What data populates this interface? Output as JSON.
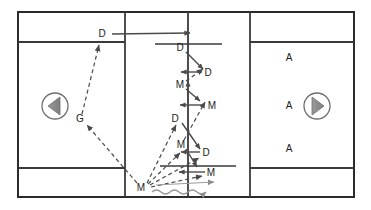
{
  "diagram": {
    "field": {
      "outer_border": {
        "x": 18,
        "y": 12,
        "width": 336,
        "height": 185
      },
      "border_color": "#2b2b2b",
      "line_color": "#3a3a3a",
      "background": "#ffffff",
      "vertical_lines_x": [
        125,
        188,
        250
      ],
      "horizontal_lines": [
        {
          "y": 42,
          "x1": 18,
          "x2": 125
        },
        {
          "y": 42,
          "x1": 250,
          "x2": 354
        },
        {
          "y": 168,
          "x1": 18,
          "x2": 125
        },
        {
          "y": 168,
          "x1": 250,
          "x2": 354
        },
        {
          "y": 44,
          "x1": 155,
          "x2": 222
        },
        {
          "y": 166,
          "x1": 160,
          "x2": 236
        }
      ]
    },
    "goals": [
      {
        "name": "left-goal",
        "cx": 55,
        "cy": 106,
        "r": 13,
        "direction": "left"
      },
      {
        "name": "right-goal",
        "cx": 317,
        "cy": 106,
        "r": 13,
        "direction": "right"
      }
    ],
    "players": [
      {
        "id": "D1",
        "label": "D",
        "x": 102,
        "y": 34
      },
      {
        "id": "D2",
        "label": "D",
        "x": 180,
        "y": 48
      },
      {
        "id": "D3",
        "label": "D",
        "x": 208,
        "y": 73
      },
      {
        "id": "M1",
        "label": "M",
        "x": 180,
        "y": 85
      },
      {
        "id": "M2",
        "label": "M",
        "x": 212,
        "y": 106
      },
      {
        "id": "D4",
        "label": "D",
        "x": 175,
        "y": 119
      },
      {
        "id": "M3",
        "label": "M",
        "x": 181,
        "y": 145
      },
      {
        "id": "D5",
        "label": "D",
        "x": 206,
        "y": 153
      },
      {
        "id": "M4",
        "label": "M",
        "x": 211,
        "y": 173
      },
      {
        "id": "M5",
        "label": "M",
        "x": 141,
        "y": 188
      },
      {
        "id": "G1",
        "label": "G",
        "x": 80,
        "y": 119
      },
      {
        "id": "A1",
        "label": "A",
        "x": 289,
        "y": 58
      },
      {
        "id": "A2",
        "label": "A",
        "x": 289,
        "y": 106
      },
      {
        "id": "A3",
        "label": "A",
        "x": 289,
        "y": 149
      }
    ],
    "movement_arrows": [
      {
        "name": "run-D1-to-center",
        "kind": "solid",
        "from": [
          112,
          34
        ],
        "to": [
          190,
          33
        ]
      },
      {
        "name": "run-D2-diagonal",
        "kind": "solid",
        "from": [
          186,
          52
        ],
        "to": [
          202,
          68
        ]
      },
      {
        "name": "run-D3-to-line",
        "kind": "solid",
        "from": [
          202,
          72
        ],
        "to": [
          182,
          72
        ]
      },
      {
        "name": "run-M1-diagonal",
        "kind": "solid",
        "from": [
          186,
          89
        ],
        "to": [
          200,
          101
        ]
      },
      {
        "name": "run-M2-to-line",
        "kind": "solid",
        "from": [
          205,
          105
        ],
        "to": [
          181,
          105
        ]
      },
      {
        "name": "run-D4-diagonal",
        "kind": "solid",
        "from": [
          182,
          123
        ],
        "to": [
          199,
          148
        ]
      },
      {
        "name": "run-D5-to-line",
        "kind": "solid",
        "from": [
          200,
          152
        ],
        "to": [
          182,
          152
        ]
      },
      {
        "name": "run-M3-diagonal",
        "kind": "solid",
        "from": [
          186,
          149
        ],
        "to": [
          197,
          166
        ]
      },
      {
        "name": "run-M4-to-line",
        "kind": "solid",
        "from": [
          205,
          172
        ],
        "to": [
          180,
          172
        ]
      },
      {
        "name": "run-center-up",
        "kind": "solid",
        "from": [
          188,
          96
        ],
        "to": [
          188,
          82
        ]
      }
    ],
    "pass_arrows": [
      {
        "name": "pass-G-to-D1",
        "kind": "dashed",
        "from": [
          82,
          114
        ],
        "to": [
          98,
          44
        ]
      },
      {
        "name": "pass-M5-to-G",
        "kind": "dashed",
        "from": [
          137,
          183
        ],
        "to": [
          86,
          124
        ]
      },
      {
        "name": "pass-M5-to-D4",
        "kind": "dashed",
        "from": [
          147,
          183
        ],
        "to": [
          176,
          124
        ]
      },
      {
        "name": "pass-M5-to-M3",
        "kind": "dashed",
        "from": [
          148,
          184
        ],
        "to": [
          180,
          152
        ]
      },
      {
        "name": "pass-M5-to-D5",
        "kind": "dashed",
        "from": [
          150,
          185
        ],
        "to": [
          199,
          157
        ]
      },
      {
        "name": "pass-M5-to-M4",
        "kind": "dashed",
        "from": [
          151,
          187
        ],
        "to": [
          202,
          175
        ]
      },
      {
        "name": "pass-M3-up-to-M2",
        "kind": "dashed",
        "from": [
          184,
          140
        ],
        "to": [
          205,
          101
        ]
      },
      {
        "name": "pass-M1-up-to-D3",
        "kind": "dashed",
        "from": [
          186,
          80
        ],
        "to": [
          203,
          68
        ]
      }
    ],
    "dribble": {
      "name": "dribble-path",
      "kind": "wavy",
      "from": [
        152,
        192
      ],
      "to": [
        218,
        186
      ],
      "amplitude": 3,
      "wavelength": 9
    }
  },
  "legend_keys": {
    "D": "defender",
    "M": "midfielder",
    "A": "attacker",
    "G": "goalkeeper"
  }
}
